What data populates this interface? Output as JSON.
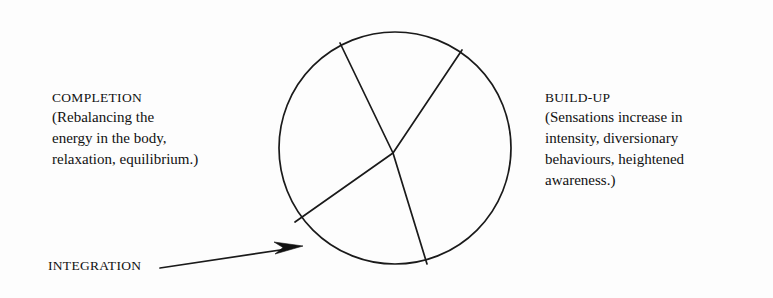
{
  "diagram": {
    "circle": {
      "center_x": 395,
      "center_y": 148,
      "radius": 116,
      "stroke_color": "#1a1a1a"
    },
    "segments": [
      {
        "name": "build-up-segment",
        "spoke_angle_deg": -57
      },
      {
        "name": "completion-segment",
        "spoke_angle_deg": -118
      },
      {
        "name": "integration-segment",
        "spoke_angle_deg": 140
      }
    ],
    "annotations": [
      {
        "id": "completion",
        "heading": "COMPLETION",
        "body_lines": [
          "(Rebalancing the",
          "energy in the body,",
          "relaxation, equilibrium.)"
        ]
      },
      {
        "id": "build-up",
        "heading": "BUILD-UP",
        "body_lines": [
          "(Sensations increase in",
          "intensity, diversionary",
          "behaviours, heightened",
          "awareness.)"
        ]
      },
      {
        "id": "integration",
        "heading": "INTEGRATION",
        "body_lines": []
      }
    ],
    "pointer": {
      "name": "integration-arrow",
      "from_x": 160,
      "from_y": 268,
      "to_x": 303,
      "to_y": 246
    },
    "colors": {
      "background": "#fdfdfd",
      "ink": "#111111",
      "line": "#1a1a1a"
    }
  }
}
